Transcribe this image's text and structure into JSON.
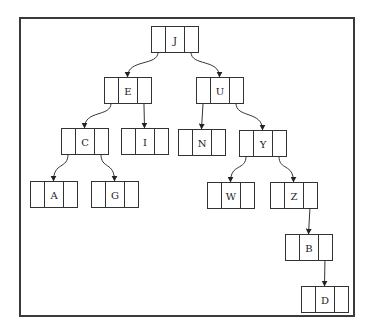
{
  "diagram": {
    "type": "binary-tree",
    "root": "J",
    "nodes": [
      {
        "id": "J",
        "label": "J"
      },
      {
        "id": "E",
        "label": "E"
      },
      {
        "id": "U",
        "label": "U"
      },
      {
        "id": "C",
        "label": "C"
      },
      {
        "id": "I",
        "label": "I"
      },
      {
        "id": "N",
        "label": "N"
      },
      {
        "id": "Y",
        "label": "Y"
      },
      {
        "id": "A",
        "label": "A"
      },
      {
        "id": "G",
        "label": "G"
      },
      {
        "id": "W",
        "label": "W"
      },
      {
        "id": "Z",
        "label": "Z"
      },
      {
        "id": "B",
        "label": "B"
      },
      {
        "id": "D",
        "label": "D"
      }
    ],
    "edges": [
      {
        "from": "J",
        "to": "E",
        "side": "left"
      },
      {
        "from": "J",
        "to": "U",
        "side": "right"
      },
      {
        "from": "E",
        "to": "C",
        "side": "left"
      },
      {
        "from": "E",
        "to": "I",
        "side": "right"
      },
      {
        "from": "U",
        "to": "N",
        "side": "left"
      },
      {
        "from": "U",
        "to": "Y",
        "side": "right"
      },
      {
        "from": "C",
        "to": "A",
        "side": "left"
      },
      {
        "from": "C",
        "to": "G",
        "side": "right"
      },
      {
        "from": "Y",
        "to": "W",
        "side": "left"
      },
      {
        "from": "Y",
        "to": "Z",
        "side": "right"
      },
      {
        "from": "Z",
        "to": "B",
        "side": "right"
      },
      {
        "from": "B",
        "to": "D",
        "side": "right"
      }
    ]
  }
}
